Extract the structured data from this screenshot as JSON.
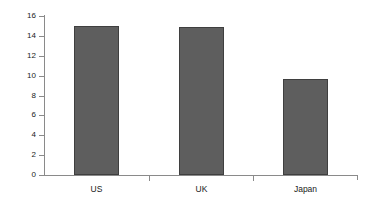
{
  "chart_data": {
    "type": "bar",
    "title": "",
    "subtitle": "",
    "xlabel": "",
    "ylabel": "",
    "categories": [
      "US",
      "UK",
      "Japan"
    ],
    "values": [
      15.0,
      14.9,
      9.7
    ],
    "series": [
      {
        "name": "",
        "values": [
          15.0,
          14.9,
          9.7
        ]
      }
    ],
    "ylim": [
      0,
      16
    ],
    "ytick_values": [
      0,
      2,
      4,
      6,
      8,
      10,
      12,
      14,
      16
    ],
    "ytick_labels": [
      "0",
      "2",
      "4",
      "6",
      "8",
      "10",
      "12",
      "14",
      "16"
    ],
    "grid": false,
    "legend": false,
    "legend_position": "none",
    "annotations": [],
    "bar_color": "#5e5e5e",
    "bar_border_color": "#3f3f3f",
    "axis_color": "#8a8a8a",
    "background_color": "#ffffff"
  }
}
